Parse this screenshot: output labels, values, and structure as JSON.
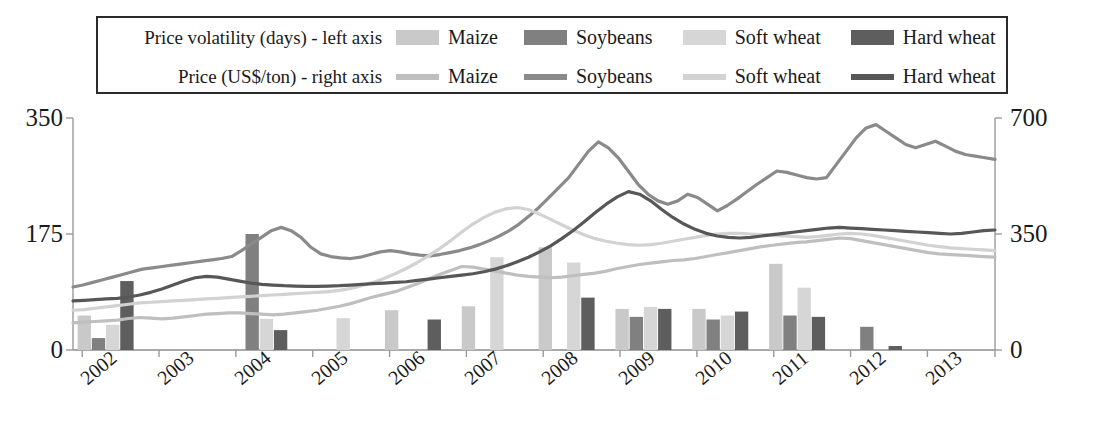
{
  "legend": {
    "rows": [
      {
        "title": "Price volatility (days) - left axis",
        "style": "bar",
        "entries": [
          {
            "label": "Maize",
            "color": "#c9c9c9"
          },
          {
            "label": "Soybeans",
            "color": "#808080"
          },
          {
            "label": "Soft wheat",
            "color": "#d6d6d6"
          },
          {
            "label": "Hard wheat",
            "color": "#5e5e5e"
          }
        ]
      },
      {
        "title": "Price (US$/ton) - right axis",
        "style": "line",
        "entries": [
          {
            "label": "Maize",
            "color": "#bfbfbf"
          },
          {
            "label": "Soybeans",
            "color": "#8a8a8a"
          },
          {
            "label": "Soft wheat",
            "color": "#d2d2d2"
          },
          {
            "label": "Hard wheat",
            "color": "#575757"
          }
        ]
      }
    ]
  },
  "axes": {
    "left": {
      "label": "Price volatility (days)",
      "ticks": [
        "0",
        "175",
        "350"
      ],
      "min": 0,
      "max": 350
    },
    "right": {
      "label": "Price (US$/ton)",
      "ticks": [
        "0",
        "350",
        "700"
      ],
      "min": 0,
      "max": 700
    },
    "x": {
      "ticks": [
        "2002",
        "2003",
        "2004",
        "2005",
        "2006",
        "2007",
        "2008",
        "2009",
        "2010",
        "2011",
        "2012",
        "2013"
      ]
    }
  },
  "chart_data": {
    "type": "bar",
    "title": "",
    "xlabel": "",
    "ylabel": "Price volatility (days)",
    "y2label": "Price (US$/ton)",
    "ylim": [
      0,
      350
    ],
    "y2lim": [
      0,
      700
    ],
    "grid": false,
    "legend_position": "top",
    "categories": [
      "2002",
      "2003",
      "2004",
      "2005",
      "2006",
      "2007",
      "2008",
      "2009",
      "2010",
      "2011",
      "2012",
      "2013"
    ],
    "bar_series": [
      {
        "name": "Maize",
        "color": "#c9c9c9",
        "values": [
          52,
          0,
          0,
          0,
          60,
          66,
          155,
          62,
          62,
          130,
          0,
          0
        ]
      },
      {
        "name": "Soybeans",
        "color": "#808080",
        "values": [
          18,
          0,
          175,
          0,
          0,
          0,
          0,
          50,
          46,
          52,
          35,
          0
        ]
      },
      {
        "name": "Soft wheat",
        "color": "#d6d6d6",
        "values": [
          38,
          0,
          47,
          48,
          0,
          140,
          132,
          65,
          52,
          94,
          0,
          0
        ]
      },
      {
        "name": "Hard wheat",
        "color": "#5e5e5e",
        "values": [
          104,
          0,
          30,
          0,
          46,
          0,
          79,
          62,
          58,
          50,
          6,
          0
        ]
      }
    ],
    "line_series": [
      {
        "name": "Maize",
        "color": "#bfbfbf",
        "axis": "right",
        "values": [
          82,
          84,
          86,
          88,
          90,
          95,
          98,
          96,
          94,
          96,
          100,
          104,
          108,
          110,
          112,
          112,
          110,
          108,
          106,
          108,
          112,
          116,
          120,
          126,
          132,
          140,
          150,
          160,
          168,
          176,
          188,
          200,
          214,
          228,
          240,
          252,
          250,
          244,
          238,
          232,
          226,
          222,
          220,
          218,
          220,
          224,
          228,
          232,
          238,
          246,
          252,
          258,
          262,
          266,
          270,
          272,
          276,
          282,
          288,
          294,
          300,
          306,
          312,
          316,
          320,
          324,
          326,
          330,
          334,
          338,
          336,
          330,
          324,
          318,
          312,
          306,
          300,
          294,
          290,
          288,
          286,
          284,
          282,
          280
        ]
      },
      {
        "name": "Soybeans",
        "color": "#8a8a8a",
        "axis": "right",
        "values": [
          190,
          196,
          204,
          212,
          220,
          228,
          236,
          244,
          248,
          252,
          256,
          260,
          264,
          268,
          272,
          276,
          282,
          300,
          320,
          340,
          360,
          370,
          360,
          340,
          310,
          290,
          282,
          278,
          276,
          280,
          288,
          296,
          300,
          296,
          290,
          286,
          284,
          288,
          294,
          300,
          308,
          318,
          330,
          344,
          360,
          380,
          404,
          430,
          460,
          490,
          520,
          560,
          600,
          628,
          610,
          580,
          540,
          500,
          470,
          450,
          440,
          450,
          470,
          460,
          440,
          420,
          436,
          456,
          478,
          500,
          520,
          540,
          536,
          528,
          520,
          516,
          520,
          560,
          600,
          640,
          670,
          680,
          660,
          640,
          620,
          610,
          620,
          630,
          615,
          600,
          590,
          585,
          580,
          575
        ]
      },
      {
        "name": "Soft wheat",
        "color": "#d2d2d2",
        "axis": "right",
        "values": [
          120,
          122,
          126,
          130,
          134,
          138,
          142,
          144,
          146,
          148,
          150,
          152,
          154,
          156,
          158,
          160,
          162,
          164,
          166,
          168,
          170,
          172,
          174,
          176,
          180,
          186,
          194,
          204,
          216,
          230,
          246,
          264,
          284,
          306,
          330,
          356,
          380,
          400,
          416,
          426,
          430,
          424,
          410,
          394,
          378,
          362,
          348,
          336,
          328,
          322,
          318,
          316,
          318,
          322,
          328,
          334,
          340,
          346,
          350,
          352,
          352,
          350,
          348,
          346,
          344,
          342,
          340,
          342,
          346,
          350,
          352,
          350,
          346,
          340,
          334,
          328,
          322,
          316,
          312,
          308,
          306,
          304,
          302,
          300
        ]
      },
      {
        "name": "Hard wheat",
        "color": "#575757",
        "axis": "right",
        "values": [
          148,
          150,
          152,
          154,
          156,
          160,
          166,
          174,
          184,
          196,
          208,
          218,
          222,
          220,
          214,
          208,
          202,
          198,
          196,
          194,
          193,
          192,
          192,
          193,
          194,
          196,
          198,
          200,
          202,
          204,
          206,
          210,
          214,
          218,
          222,
          226,
          230,
          236,
          244,
          254,
          266,
          280,
          296,
          314,
          336,
          360,
          386,
          414,
          440,
          462,
          478,
          470,
          450,
          424,
          400,
          380,
          364,
          352,
          344,
          340,
          338,
          340,
          344,
          348,
          352,
          356,
          360,
          364,
          368,
          370,
          368,
          366,
          364,
          362,
          360,
          358,
          356,
          354,
          352,
          350,
          352,
          356,
          360,
          362
        ]
      }
    ]
  }
}
